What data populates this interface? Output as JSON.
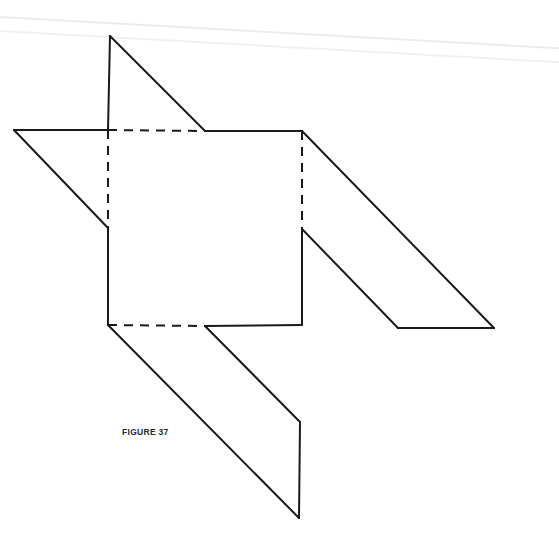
{
  "figure": {
    "caption": "FIGURE 37",
    "stroke_color": "#1a1a1a",
    "background_color": "#ffffff",
    "square": {
      "x1": 108,
      "y1": 130,
      "x2": 302,
      "y2": 325
    },
    "fold_lines": [
      {
        "name": "top-fold",
        "from": [
          108,
          130
        ],
        "to": [
          205,
          131
        ]
      },
      {
        "name": "left-fold",
        "from": [
          108,
          130
        ],
        "to": [
          108,
          228
        ]
      },
      {
        "name": "right-fold",
        "from": [
          302,
          131
        ],
        "to": [
          302,
          229
        ]
      },
      {
        "name": "bottom-fold",
        "from": [
          108,
          325
        ],
        "to": [
          205,
          326
        ]
      }
    ],
    "solid_edges": [
      {
        "name": "top-flap-vertical",
        "points": [
          [
            108,
            130
          ],
          [
            110,
            36
          ]
        ]
      },
      {
        "name": "top-flap-diagonal",
        "points": [
          [
            110,
            36
          ],
          [
            205,
            131
          ]
        ]
      },
      {
        "name": "top-square-edge",
        "points": [
          [
            205,
            131
          ],
          [
            302,
            131
          ]
        ]
      },
      {
        "name": "left-flap-top",
        "points": [
          [
            14,
            130
          ],
          [
            108,
            130
          ]
        ]
      },
      {
        "name": "left-flap-diagonal",
        "points": [
          [
            14,
            130
          ],
          [
            108,
            228
          ]
        ]
      },
      {
        "name": "left-square-edge",
        "points": [
          [
            108,
            228
          ],
          [
            108,
            325
          ]
        ]
      },
      {
        "name": "right-flap-outer-diagonal",
        "points": [
          [
            302,
            131
          ],
          [
            494,
            328
          ]
        ]
      },
      {
        "name": "right-flap-bottom",
        "points": [
          [
            494,
            328
          ],
          [
            398,
            328
          ]
        ]
      },
      {
        "name": "right-flap-inner-diagonal",
        "points": [
          [
            398,
            328
          ],
          [
            302,
            229
          ]
        ]
      },
      {
        "name": "right-square-edge",
        "points": [
          [
            302,
            229
          ],
          [
            302,
            325
          ]
        ]
      },
      {
        "name": "bottom-square-edge",
        "points": [
          [
            205,
            326
          ],
          [
            302,
            325
          ]
        ]
      },
      {
        "name": "bottom-flap-outer-diagonal",
        "points": [
          [
            108,
            325
          ],
          [
            299,
            518
          ]
        ]
      },
      {
        "name": "bottom-flap-vertical",
        "points": [
          [
            299,
            518
          ],
          [
            300,
            422
          ]
        ]
      },
      {
        "name": "bottom-flap-inner-diagonal",
        "points": [
          [
            300,
            422
          ],
          [
            205,
            326
          ]
        ]
      }
    ]
  }
}
